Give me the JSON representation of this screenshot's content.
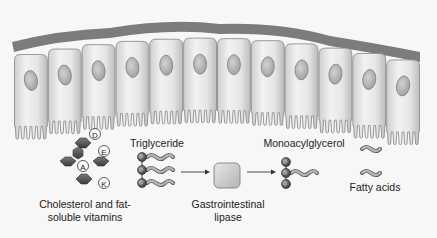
{
  "diagram": {
    "colors": {
      "background": "#f7f7f7",
      "cell_fill": "#e4e4e4",
      "cell_edge": "#9a9a9a",
      "basal_membrane": "#7c7c7c",
      "nucleus": "#b8b8b8",
      "sterol_ring": "#555555",
      "glycerol_bead": "#6a6a6a",
      "fatty_acid_tail": "#a8a8a8",
      "lipase_box": "#cfcfcf",
      "arrow": "#333333",
      "text": "#222222"
    },
    "epithelium": {
      "cell_count": 12
    },
    "vitamins": [
      "D",
      "E",
      "A",
      "K"
    ],
    "labels": {
      "cholesterol": "Cholesterol and fat-\nsoluble vitamins",
      "triglyceride": "Triglyceride",
      "lipase": "Gastrointestinal\nlipase",
      "monoacylglycerol": "Monoacylglycerol",
      "fatty_acids": "Fatty acids"
    }
  }
}
